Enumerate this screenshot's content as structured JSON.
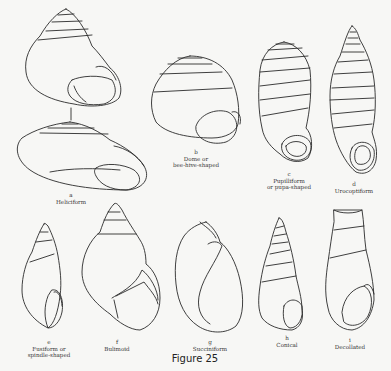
{
  "figure": {
    "caption": "Figure 25",
    "shells": [
      {
        "letter": "a",
        "name": "Heliciform",
        "name2": ""
      },
      {
        "letter": "b",
        "name": "Dome or",
        "name2": "bee-hive-shaped"
      },
      {
        "letter": "c",
        "name": "Pupilliform",
        "name2": "or pupa-shaped"
      },
      {
        "letter": "d",
        "name": "Urocoptiform",
        "name2": ""
      },
      {
        "letter": "e",
        "name": "Fusiform or",
        "name2": "spindle-shaped"
      },
      {
        "letter": "f",
        "name": "Bulimoid",
        "name2": ""
      },
      {
        "letter": "g",
        "name": "Succiniform",
        "name2": ""
      },
      {
        "letter": "h",
        "name": "Conical",
        "name2": ""
      },
      {
        "letter": "i",
        "name": "Decollated",
        "name2": ""
      }
    ]
  }
}
